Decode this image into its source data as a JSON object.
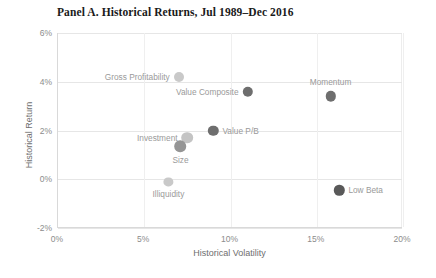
{
  "chart_data": {
    "type": "scatter",
    "title": "Panel A. Historical Returns, Jul 1989–Dec 2016",
    "xlabel": "Historical Volatility",
    "ylabel": "Historical Return",
    "xlim": [
      0,
      20
    ],
    "ylim": [
      -2,
      6
    ],
    "xticks": [
      "0%",
      "5%",
      "10%",
      "15%",
      "20%"
    ],
    "xtick_values": [
      0,
      5,
      10,
      15,
      20
    ],
    "yticks": [
      "6%",
      "4%",
      "2%",
      "0%",
      "-2%"
    ],
    "ytick_values": [
      6,
      4,
      2,
      0,
      -2
    ],
    "grid": "horizontal-and-vertical-light",
    "legend": "none",
    "units": "percent",
    "points": [
      {
        "name": "Gross Profitability",
        "x": 7.0,
        "y": 4.2,
        "color": "#c9c9c9",
        "radius": 5.0,
        "label_pos": "left"
      },
      {
        "name": "Value Composite",
        "x": 11.0,
        "y": 3.6,
        "color": "#6e6e6e",
        "radius": 5.2,
        "label_pos": "left"
      },
      {
        "name": "Momentum",
        "x": 15.8,
        "y": 3.4,
        "color": "#6e6e6e",
        "radius": 5.2,
        "label_pos": "above"
      },
      {
        "name": "Value P/B",
        "x": 9.0,
        "y": 2.0,
        "color": "#6e6e6e",
        "radius": 5.2,
        "label_pos": "right"
      },
      {
        "name": "Investment",
        "x": 7.5,
        "y": 1.7,
        "color": "#c4c4c4",
        "radius": 5.8,
        "label_pos": "left"
      },
      {
        "name": "Size",
        "x": 7.1,
        "y": 1.35,
        "color": "#959595",
        "radius": 5.8,
        "label_pos": "below"
      },
      {
        "name": "Illiquidity",
        "x": 6.4,
        "y": -0.1,
        "color": "#c9c9c9",
        "radius": 4.6,
        "label_pos": "below"
      },
      {
        "name": "Low Beta",
        "x": 16.3,
        "y": -0.45,
        "color": "#595959",
        "radius": 5.2,
        "label_pos": "right"
      }
    ]
  },
  "colors": {
    "grid": "#e6e6e6",
    "axis": "#d9d9d9",
    "tick_text": "#8c8c8c",
    "axis_label_text": "#6e6e6e",
    "title_text": "#1a1a1a",
    "point_label_text": "#9a9a9a"
  }
}
